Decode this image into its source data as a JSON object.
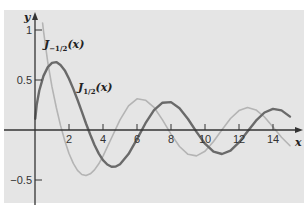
{
  "chart_data": {
    "type": "line",
    "title": "",
    "xlabel": "x",
    "ylabel": "y",
    "xlim": [
      0,
      15.3
    ],
    "ylim": [
      -0.75,
      1.2
    ],
    "grid": false,
    "x_ticks": [
      2,
      4,
      6,
      8,
      10,
      12,
      14
    ],
    "x_tick_labels": [
      "2",
      "4",
      "6",
      "8",
      "10",
      "12",
      "14"
    ],
    "y_ticks": [
      1,
      0.5,
      -0.5
    ],
    "y_tick_labels": [
      "1",
      "0.5",
      "−0.5"
    ],
    "series": [
      {
        "name": "J_{1/2}(x)",
        "label_main": "J",
        "label_sub": "1/2",
        "label_arg": "(x)",
        "color": "#6a6a6a",
        "width": 2.4,
        "x": [
          0.02,
          0.1,
          0.25,
          0.5,
          0.75,
          1,
          1.25,
          1.5,
          1.75,
          2,
          2.25,
          2.5,
          2.75,
          3,
          3.25,
          3.5,
          3.75,
          4,
          4.25,
          4.5,
          4.75,
          5,
          5.5,
          6,
          6.5,
          7,
          7.5,
          8,
          8.5,
          9,
          9.5,
          10,
          10.5,
          11,
          11.5,
          12,
          12.5,
          13,
          13.5,
          14,
          14.5,
          15
        ],
        "y": [
          0.113,
          0.2519,
          0.3948,
          0.541,
          0.6286,
          0.6714,
          0.6788,
          0.65,
          0.5964,
          0.513,
          0.4109,
          0.302,
          0.1841,
          0.0652,
          -0.0482,
          -0.1499,
          -0.2362,
          -0.3016,
          -0.3453,
          -0.3666,
          -0.3653,
          -0.3422,
          -0.2405,
          -0.0912,
          0.0676,
          0.1985,
          0.2734,
          0.2791,
          0.2175,
          0.1096,
          -0.0193,
          -0.1373,
          -0.217,
          -0.2403,
          -0.2072,
          -0.1237,
          -0.0152,
          0.0926,
          0.1745,
          0.2112,
          0.196,
          0.1341
        ]
      },
      {
        "name": "J_{-1/2}(x)",
        "label_main": "J",
        "label_sub": "−1/2",
        "label_arg": "(x)",
        "color": "#b4b4b4",
        "width": 1.6,
        "x": [
          0.45,
          0.5,
          0.75,
          1,
          1.25,
          1.5,
          1.75,
          2,
          2.25,
          2.5,
          2.75,
          3,
          3.25,
          3.5,
          3.75,
          4,
          4.5,
          5,
          5.5,
          6,
          6.5,
          7,
          7.5,
          8,
          8.5,
          9,
          9.5,
          10,
          10.5,
          11,
          11.5,
          12,
          12.5,
          13,
          13.5,
          14,
          14.5,
          15
        ],
        "y": [
          1.07,
          0.9903,
          0.6754,
          0.4311,
          0.2247,
          0.046,
          -0.1072,
          -0.2348,
          -0.3338,
          -0.4044,
          -0.4453,
          -0.456,
          -0.4383,
          -0.399,
          -0.3382,
          -0.2608,
          -0.08,
          0.1012,
          0.2406,
          0.3116,
          0.2979,
          0.2274,
          0.1009,
          -0.0409,
          -0.1653,
          -0.243,
          -0.2592,
          -0.2117,
          -0.1146,
          0.0031,
          0.1149,
          0.194,
          0.2254,
          0.2012,
          0.1296,
          0.0293,
          -0.0715,
          -0.1565
        ]
      }
    ]
  },
  "colors": {
    "panel_bg": "#e5e5e5",
    "axis": "#333333"
  }
}
